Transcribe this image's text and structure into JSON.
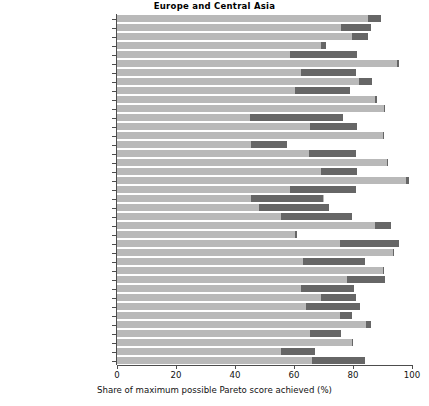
{
  "chart_data": {
    "type": "bar",
    "title": "Europe and Central Asia",
    "xlabel": "Share of maximum possible Pareto score achieved (%)",
    "ylabel": "",
    "orientation": "horizontal",
    "xlim": [
      0,
      100
    ],
    "xticks": [
      0,
      20,
      40,
      60,
      80,
      100
    ],
    "xticklabels": [
      "0",
      "20",
      "40",
      "60",
      "80",
      "100"
    ],
    "grid": false,
    "legend": "none",
    "colors": {
      "light_bar": "#b9b9b9",
      "dark_segment": "#666666",
      "axis": "#4d4d4d",
      "text": "#111111",
      "background": "#ffffff"
    },
    "categories": [
      "Albania",
      "Armenia",
      "Austria",
      "Azerbaijan",
      "Belarus",
      "Belgium",
      "Bosnia and Herzegovina",
      "Bulgaria",
      "Croatia",
      "Czech Republic",
      "Denmark",
      "Estonia",
      "Finland",
      "France",
      "Georgia",
      "Germany",
      "Greece",
      "Hungary",
      "Iceland",
      "Italy",
      "Latvia",
      "Lithuania",
      "Moldova",
      "Montenegro",
      "Netherlands",
      "North Macedonia",
      "Norway",
      "Poland",
      "Portugal",
      "Romania",
      "Serbia",
      "Slovakia",
      "Slovenia",
      "Spain",
      "Sweden",
      "Switzerland",
      "Türkiye",
      "Ukraine",
      "United Kingdom"
    ],
    "series": [
      {
        "name": "Share of maximum possible Pareto score achieved (%)",
        "values": [
          89.5,
          86.0,
          85.0,
          71.0,
          81.5,
          95.5,
          81.0,
          86.5,
          79.0,
          88.0,
          91.0,
          76.5,
          81.5,
          90.5,
          57.5,
          81.0,
          92.0,
          81.5,
          99.0,
          81.0,
          70.0,
          72.0,
          79.5,
          93.0,
          61.0,
          95.5,
          94.0,
          84.0,
          90.5,
          91.0,
          80.5,
          81.0,
          82.5,
          79.5,
          86.0,
          76.0,
          80.0,
          67.0,
          84.0
        ]
      },
      {
        "name": "Dark segment (highlighted range)",
        "segments": [
          {
            "start": 85.0,
            "end": 89.5
          },
          {
            "start": 76.0,
            "end": 86.0
          },
          {
            "start": 79.5,
            "end": 85.0
          },
          {
            "start": 69.0,
            "end": 71.0
          },
          {
            "start": 58.5,
            "end": 81.5
          },
          {
            "start": 95.0,
            "end": 95.5
          },
          {
            "start": 62.5,
            "end": 81.0
          },
          {
            "start": 82.0,
            "end": 86.5
          },
          {
            "start": 60.5,
            "end": 79.0
          },
          {
            "start": 87.5,
            "end": 88.0
          },
          {
            "start": 90.5,
            "end": 91.0
          },
          {
            "start": 45.0,
            "end": 76.5
          },
          {
            "start": 65.5,
            "end": 81.5
          },
          {
            "start": 90.0,
            "end": 90.5
          },
          {
            "start": 45.5,
            "end": 57.5
          },
          {
            "start": 65.0,
            "end": 81.0
          },
          {
            "start": 91.5,
            "end": 92.0
          },
          {
            "start": 69.0,
            "end": 81.5
          },
          {
            "start": 98.0,
            "end": 99.0
          },
          {
            "start": 58.5,
            "end": 81.0
          },
          {
            "start": 45.5,
            "end": 70.0
          },
          {
            "start": 48.0,
            "end": 72.0
          },
          {
            "start": 55.5,
            "end": 79.5
          },
          {
            "start": 87.5,
            "end": 93.0
          },
          {
            "start": 60.5,
            "end": 61.0
          },
          {
            "start": 75.5,
            "end": 95.5
          },
          {
            "start": 93.5,
            "end": 94.0
          },
          {
            "start": 63.0,
            "end": 84.0
          },
          {
            "start": 90.0,
            "end": 90.5
          },
          {
            "start": 78.0,
            "end": 91.0
          },
          {
            "start": 62.5,
            "end": 80.5
          },
          {
            "start": 69.0,
            "end": 81.0
          },
          {
            "start": 64.0,
            "end": 82.5
          },
          {
            "start": 75.5,
            "end": 79.5
          },
          {
            "start": 84.5,
            "end": 86.0
          },
          {
            "start": 65.5,
            "end": 76.0
          },
          {
            "start": 79.5,
            "end": 80.0
          },
          {
            "start": 55.5,
            "end": 67.0
          },
          {
            "start": 66.0,
            "end": 84.0
          }
        ]
      }
    ]
  }
}
